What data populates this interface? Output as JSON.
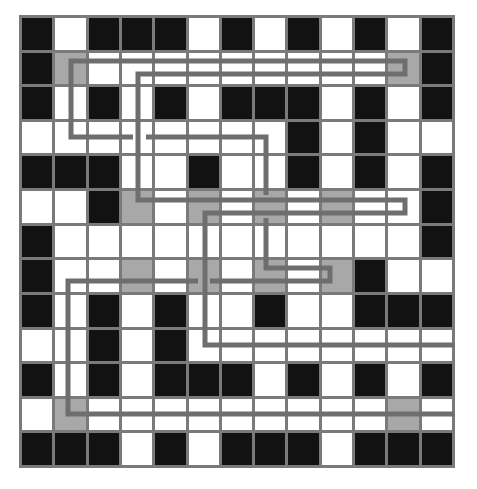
{
  "puzzle": {
    "rows": 13,
    "cols": 13,
    "legend": {
      "B": "black cell",
      "W": "white cell",
      "G": "gray cell"
    },
    "colors": {
      "black": "#121212",
      "white": "#ffffff",
      "gray": "#a8a8a8",
      "grid": "#7a7a7a",
      "path": "#6e6e6e"
    },
    "grid": [
      "BWBBBWBWBWBWB",
      "BGWWWWWWWWWGB",
      "BWBWBWBBBWBWB",
      "WWWWWWWWBWBWW",
      "BBBWWBWWBWBWB",
      "WWBGWGWGWGWWB",
      "BWWWWWWWWWWWB",
      "BWWGWGWGWGBWW",
      "BWBWBWWBWWBBB",
      "WWBWBWWWWWWWW",
      "BWBWBBBWBWBWB",
      "WGWWWWWWWWWGW",
      "BBBWBWBBBWBBB"
    ],
    "paths": [
      "133,137 71,137 71,61 405,61 405,74 138,74 138,200 405,200 405,213 205,213 205,345 455,345",
      "146,137 266,137 266,195",
      "198,281 68,281 68,414 455,414",
      "210,281 330,281 330,268 266,268 266,218"
    ]
  }
}
